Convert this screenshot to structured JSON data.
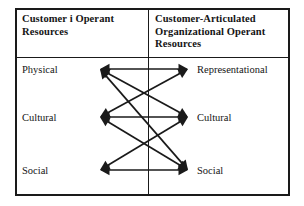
{
  "figure": {
    "title_left_lines": [
      "Customer i Operant",
      "Resources"
    ],
    "title_right_lines": [
      "Customer-Articulated",
      "Organizational  Operant",
      "Resources"
    ],
    "line_color": "#1a1a1a",
    "text_color": "#141414",
    "background": "#ffffff"
  },
  "left_column": {
    "header": "Customer i Operant Resources",
    "nodes": [
      {
        "label": "Physical",
        "x": 100,
        "y": 69,
        "label_x": 22,
        "label_y": 64
      },
      {
        "label": "Cultural",
        "x": 100,
        "y": 117,
        "label_x": 22,
        "label_y": 112
      },
      {
        "label": "Social",
        "x": 100,
        "y": 170,
        "label_x": 22,
        "label_y": 165
      }
    ]
  },
  "right_column": {
    "header": "Customer-Articulated Organizational Operant Resources",
    "nodes": [
      {
        "label": "Representational",
        "x": 188,
        "y": 69,
        "label_x": 197,
        "label_y": 64
      },
      {
        "label": "Cultural",
        "x": 188,
        "y": 117,
        "label_x": 197,
        "label_y": 112
      },
      {
        "label": "Social",
        "x": 188,
        "y": 170,
        "label_x": 197,
        "label_y": 165
      }
    ]
  },
  "connections": [
    {
      "name": "physical-representational",
      "from": "left-physical",
      "to": "right-representational",
      "x1": 100,
      "y1": 69,
      "x2": 188,
      "y2": 69,
      "double_headed": true
    },
    {
      "name": "cultural-cultural",
      "from": "left-cultural",
      "to": "right-cultural",
      "x1": 100,
      "y1": 117,
      "x2": 188,
      "y2": 117,
      "double_headed": true
    },
    {
      "name": "social-social",
      "from": "left-social",
      "to": "right-social",
      "x1": 100,
      "y1": 170,
      "x2": 188,
      "y2": 170,
      "double_headed": true
    },
    {
      "name": "physical-cultural",
      "from": "left-physical",
      "to": "right-cultural",
      "x1": 100,
      "y1": 69,
      "x2": 188,
      "y2": 117,
      "double_headed": true
    },
    {
      "name": "cultural-representational",
      "from": "left-cultural",
      "to": "right-representational",
      "x1": 100,
      "y1": 117,
      "x2": 188,
      "y2": 69,
      "double_headed": true
    },
    {
      "name": "physical-social",
      "from": "left-physical",
      "to": "right-social",
      "x1": 100,
      "y1": 69,
      "x2": 188,
      "y2": 170,
      "double_headed": true
    },
    {
      "name": "social-cultural",
      "from": "left-social",
      "to": "right-cultural",
      "x1": 100,
      "y1": 170,
      "x2": 188,
      "y2": 117,
      "double_headed": true
    },
    {
      "name": "cultural-social",
      "from": "left-cultural",
      "to": "right-social",
      "x1": 100,
      "y1": 117,
      "x2": 188,
      "y2": 170,
      "double_headed": true
    }
  ]
}
